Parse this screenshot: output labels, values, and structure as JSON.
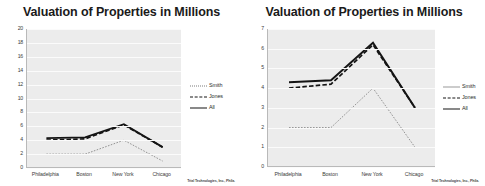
{
  "credit": "Trial Technologies, Inc., Phila.",
  "charts": [
    {
      "title": "Valuation of Properties in Millions",
      "ylim": [
        0,
        20
      ],
      "yticks": [
        "0",
        "2",
        "4",
        "6",
        "8",
        "10",
        "12",
        "14",
        "16",
        "18",
        "20"
      ],
      "categories": [
        "Philadelphia",
        "Boston",
        "New York",
        "Chicago"
      ],
      "legend": [
        "Smith",
        "Jones",
        "All"
      ]
    },
    {
      "title": "Valuation of Properties in Millions",
      "ylim": [
        0,
        7
      ],
      "yticks": [
        "0",
        "1",
        "2",
        "3",
        "4",
        "5",
        "6",
        "7"
      ],
      "categories": [
        "Philadelphia",
        "Boston",
        "New York",
        "Chicago"
      ],
      "legend": [
        "Smith",
        "Jones",
        "All"
      ]
    }
  ],
  "chart_data": [
    {
      "type": "line",
      "title": "Valuation of Properties in Millions",
      "xlabel": "",
      "ylabel": "",
      "ylim": [
        0,
        20
      ],
      "yticks": [
        0,
        2,
        4,
        6,
        8,
        10,
        12,
        14,
        16,
        18,
        20
      ],
      "grid": true,
      "legend_position": "right",
      "categories": [
        "Philadelphia",
        "Boston",
        "New York",
        "Chicago"
      ],
      "series": [
        {
          "name": "Smith",
          "style": "dotted",
          "values": [
            2.0,
            2.0,
            4.0,
            1.0
          ]
        },
        {
          "name": "Jones",
          "style": "dashed",
          "values": [
            4.0,
            4.2,
            6.2,
            3.0
          ]
        },
        {
          "name": "All",
          "style": "solid",
          "values": [
            4.3,
            4.4,
            6.3,
            3.0
          ]
        }
      ]
    },
    {
      "type": "line",
      "title": "Valuation of Properties in Millions",
      "xlabel": "",
      "ylabel": "",
      "ylim": [
        0,
        7
      ],
      "yticks": [
        0,
        1,
        2,
        3,
        4,
        5,
        6,
        7
      ],
      "grid": true,
      "legend_position": "right",
      "categories": [
        "Philadelphia",
        "Boston",
        "New York",
        "Chicago"
      ],
      "series": [
        {
          "name": "Smith",
          "style": "dotted",
          "values": [
            2.0,
            2.0,
            4.0,
            1.0
          ]
        },
        {
          "name": "Jones",
          "style": "dashed",
          "values": [
            4.0,
            4.2,
            6.2,
            3.0
          ]
        },
        {
          "name": "All",
          "style": "solid",
          "values": [
            4.3,
            4.4,
            6.3,
            3.0
          ]
        }
      ]
    }
  ]
}
